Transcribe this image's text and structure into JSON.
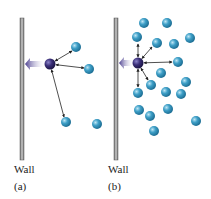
{
  "panels": [
    {
      "id": "a",
      "wall_label": "Wall",
      "panel_label": "(a)",
      "wall": {
        "x": 20,
        "y1": 18,
        "y2": 160
      },
      "dark_molecule": {
        "x": 50,
        "y": 64
      },
      "molecules": [
        [
          76,
          47
        ],
        [
          89,
          69
        ],
        [
          66,
          122
        ],
        [
          97,
          124
        ]
      ],
      "arrows_to": [
        [
          72,
          51
        ],
        [
          84,
          68
        ],
        [
          64,
          117
        ]
      ]
    },
    {
      "id": "b",
      "wall_label": "Wall",
      "panel_label": "(b)",
      "wall": {
        "x": 114,
        "y1": 18,
        "y2": 160
      },
      "dark_molecule": {
        "x": 138,
        "y": 63
      },
      "molecules": [
        [
          144,
          23
        ],
        [
          167,
          23
        ],
        [
          137,
          37
        ],
        [
          157,
          43
        ],
        [
          174,
          44
        ],
        [
          190,
          38
        ],
        [
          178,
          62
        ],
        [
          161,
          73
        ],
        [
          151,
          85
        ],
        [
          186,
          82
        ],
        [
          138,
          93
        ],
        [
          166,
          92
        ],
        [
          181,
          94
        ],
        [
          139,
          110
        ],
        [
          150,
          116
        ],
        [
          168,
          109
        ],
        [
          196,
          121
        ],
        [
          154,
          131
        ]
      ],
      "arrows_to": [
        [
          138,
          44
        ],
        [
          152,
          47
        ],
        [
          172,
          62
        ],
        [
          138,
          87
        ],
        [
          148,
          80
        ]
      ]
    }
  ],
  "colors": {
    "wall": "#9a9a9a",
    "dark": "#3a2f78",
    "light": "#3fa0c8",
    "arrow": "#5a4f9a"
  }
}
